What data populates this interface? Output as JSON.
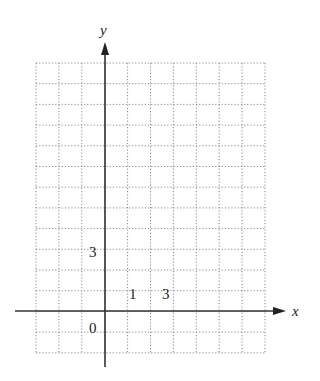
{
  "diagram": {
    "type": "coordinate-grid",
    "grid": {
      "left": 36,
      "top": 63,
      "col_width": 22.9,
      "row_height": 20.7,
      "cols": 10,
      "rows": 14,
      "line_color": "#8a8a8a"
    },
    "axes": {
      "color": "#333333",
      "x_axis": {
        "label": "x",
        "y": 311,
        "x_start": 15,
        "x_end": 286
      },
      "y_axis": {
        "label": "y",
        "x": 105,
        "y_start": 367,
        "y_end": 42
      }
    },
    "labels": [
      {
        "text": "3",
        "x": 93,
        "y": 257,
        "role": "y-tick"
      },
      {
        "text": "1",
        "x": 133,
        "y": 299,
        "role": "x-tick"
      },
      {
        "text": "3",
        "x": 166,
        "y": 299,
        "role": "x-tick"
      },
      {
        "text": "0",
        "x": 93,
        "y": 333,
        "role": "origin"
      }
    ]
  },
  "chart_data": {
    "type": "scatter",
    "title": "",
    "xlabel": "x",
    "ylabel": "y",
    "x": [],
    "y": [],
    "tick_labels": {
      "x": [
        "1",
        "3"
      ],
      "y": [
        "3"
      ],
      "origin": "0"
    },
    "xlim": [
      -3,
      7
    ],
    "ylim": [
      -2,
      12
    ],
    "grid": true
  }
}
